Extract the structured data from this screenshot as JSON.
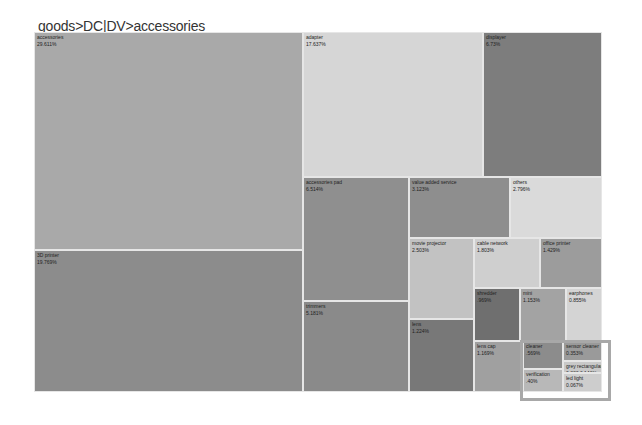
{
  "breadcrumb": "goods>DC|DV>accessories",
  "chart_data": {
    "type": "treemap",
    "title": "goods>DC|DV>accessories",
    "nodes": [
      {
        "name": "accessories",
        "value": 29.611,
        "label": "29.611%",
        "x": 0,
        "y": 0,
        "w": 269,
        "h": 218,
        "color": "#a9a9a9"
      },
      {
        "name": "3D printer",
        "value": 19.769,
        "label": "19.769%",
        "x": 0,
        "y": 218,
        "w": 269,
        "h": 142,
        "color": "#8c8c8c"
      },
      {
        "name": "adapter",
        "value": 17.637,
        "label": "17.637%",
        "x": 269,
        "y": 0,
        "w": 180,
        "h": 145,
        "color": "#d6d6d6"
      },
      {
        "name": "displayer",
        "value": 6.73,
        "label": "6.73%",
        "x": 449,
        "y": 0,
        "w": 119,
        "h": 145,
        "color": "#7d7d7d"
      },
      {
        "name": "accessories pad",
        "value": 6.514,
        "label": "6.514%",
        "x": 269,
        "y": 145,
        "w": 106,
        "h": 124,
        "color": "#8f8f8f"
      },
      {
        "name": "trimmers",
        "value": 5.181,
        "label": "5.181%",
        "x": 269,
        "y": 269,
        "w": 106,
        "h": 91,
        "color": "#8a8a8a"
      },
      {
        "name": "value added service",
        "value": 3.123,
        "label": "3.123%",
        "x": 375,
        "y": 145,
        "w": 101,
        "h": 61,
        "color": "#8e8e8e"
      },
      {
        "name": "others",
        "value": 2.796,
        "label": "2.796%",
        "x": 476,
        "y": 145,
        "w": 92,
        "h": 61,
        "color": "#dadada"
      },
      {
        "name": "movie projector",
        "value": 2.503,
        "label": "2.503%",
        "x": 375,
        "y": 206,
        "w": 65,
        "h": 81,
        "color": "#c2c2c2"
      },
      {
        "name": "cable network",
        "value": 1.803,
        "label": "1.803%",
        "x": 440,
        "y": 206,
        "w": 66,
        "h": 50,
        "color": "#cfcfcf"
      },
      {
        "name": "office printer",
        "value": 1.429,
        "label": "1.429%",
        "x": 506,
        "y": 206,
        "w": 62,
        "h": 50,
        "color": "#9c9c9c"
      },
      {
        "name": "lens",
        "value": 1.224,
        "label": "1.224%",
        "x": 375,
        "y": 287,
        "w": 65,
        "h": 73,
        "color": "#787878"
      },
      {
        "name": "shredder",
        "value": 0.969,
        "label": ".969%",
        "x": 440,
        "y": 256,
        "w": 46,
        "h": 53,
        "color": "#6f6f6f"
      },
      {
        "name": "mini",
        "value": 1.153,
        "label": "1.153%",
        "x": 486,
        "y": 256,
        "w": 46,
        "h": 53,
        "color": "#a3a3a3"
      },
      {
        "name": "earphones",
        "value": 0.855,
        "label": "0.855%",
        "x": 532,
        "y": 256,
        "w": 36,
        "h": 53,
        "color": "#d4d4d4"
      },
      {
        "name": "lens cap",
        "value": 1.169,
        "label": "1.169%",
        "x": 440,
        "y": 309,
        "w": 49,
        "h": 51,
        "color": "#a0a0a0"
      },
      {
        "name": "cleaner",
        "value": 0.569,
        "label": ".569%",
        "x": 489,
        "y": 309,
        "w": 40,
        "h": 28,
        "color": "#8c8c8c"
      },
      {
        "name": "sensor cleaner",
        "value": 0.353,
        "label": "0.353%",
        "x": 529,
        "y": 309,
        "w": 39,
        "h": 20,
        "color": "#9a9a9a"
      },
      {
        "name": "verification",
        "value": 0.4,
        "label": ".40%",
        "x": 489,
        "y": 337,
        "w": 40,
        "h": 23,
        "color": "#b8b8b8"
      },
      {
        "name": "grey rectangular",
        "value": 0.333,
        "label": "0.333 0.146%",
        "x": 529,
        "y": 329,
        "w": 39,
        "h": 12,
        "color": "#c8c8c8"
      },
      {
        "name": "led light",
        "value": 0.067,
        "label": "0.067%",
        "x": 529,
        "y": 341,
        "w": 39,
        "h": 19,
        "color": "#cdcdcd"
      }
    ]
  }
}
